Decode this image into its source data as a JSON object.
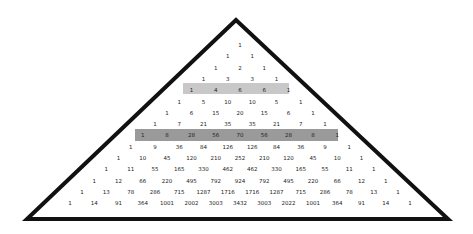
{
  "diagram": {
    "triangle": {
      "apex": [
        236,
        20
      ],
      "left": [
        27,
        219
      ],
      "right": [
        448,
        219
      ],
      "stroke": "#111111",
      "stroke_width": 4
    },
    "highlights": [
      {
        "row": 4,
        "color": "#c8c8c8",
        "x": 183,
        "y": 83,
        "w": 106,
        "h": 11
      },
      {
        "row": 8,
        "color": "#9a9a9a",
        "x": 135,
        "y": 129,
        "w": 203,
        "h": 12
      }
    ],
    "layout": {
      "center_x": 240,
      "row0_y": 45,
      "row_dy": 11.3,
      "col_dx": 24.3
    },
    "rows": [
      [
        "1"
      ],
      [
        "1",
        "1"
      ],
      [
        "1",
        "2",
        "1"
      ],
      [
        "1",
        "3",
        "3",
        "1"
      ],
      [
        "1",
        "4",
        "6",
        "6",
        "1"
      ],
      [
        "1",
        "5",
        "10",
        "10",
        "5",
        "1"
      ],
      [
        "1",
        "6",
        "15",
        "20",
        "15",
        "6",
        "1"
      ],
      [
        "1",
        "7",
        "21",
        "35",
        "35",
        "21",
        "7",
        "1"
      ],
      [
        "1",
        "8",
        "28",
        "56",
        "70",
        "56",
        "28",
        "8",
        "1"
      ],
      [
        "1",
        "9",
        "36",
        "84",
        "126",
        "126",
        "84",
        "36",
        "9",
        "1"
      ],
      [
        "1",
        "10",
        "45",
        "120",
        "210",
        "252",
        "210",
        "120",
        "45",
        "10",
        "1"
      ],
      [
        "1",
        "11",
        "55",
        "165",
        "330",
        "462",
        "462",
        "330",
        "165",
        "55",
        "11",
        "1"
      ],
      [
        "1",
        "12",
        "66",
        "220",
        "495",
        "792",
        "924",
        "792",
        "495",
        "220",
        "66",
        "12",
        "1"
      ],
      [
        "1",
        "13",
        "78",
        "286",
        "715",
        "1287",
        "1716",
        "1716",
        "1287",
        "715",
        "286",
        "78",
        "13",
        "1"
      ],
      [
        "1",
        "14",
        "91",
        "364",
        "1001",
        "2002",
        "3003",
        "3432",
        "3003",
        "2022",
        "1001",
        "364",
        "91",
        "14",
        "1"
      ]
    ]
  }
}
